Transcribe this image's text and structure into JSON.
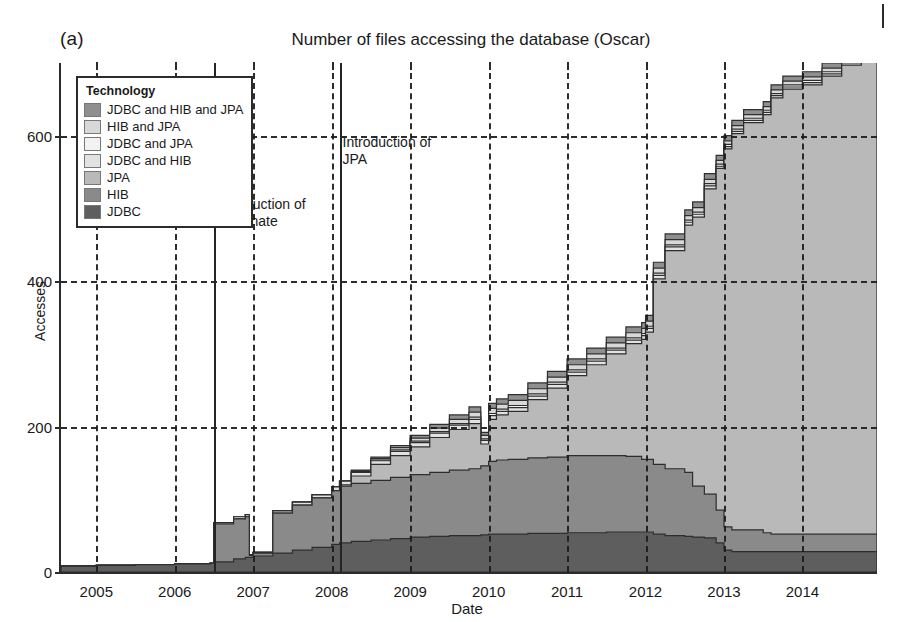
{
  "figure": {
    "panel_label": "(a)",
    "title": "Number of files accessing the database (Oscar)"
  },
  "legend": {
    "title": "Technology",
    "items": [
      {
        "label": "JDBC and HIB and JPA",
        "color": "#8f8f8f"
      },
      {
        "label": "HIB and JPA",
        "color": "#d8d8d8"
      },
      {
        "label": "JDBC and JPA",
        "color": "#f2f2f2"
      },
      {
        "label": "JDBC and HIB",
        "color": "#e2e2e2"
      },
      {
        "label": "JPA",
        "color": "#b9b9b9"
      },
      {
        "label": "HIB",
        "color": "#8a8a8a"
      },
      {
        "label": "JDBC",
        "color": "#5e5e5e"
      }
    ]
  },
  "annotations": [
    {
      "text": "Introduction of\nHibernate",
      "x": 2006.5
    },
    {
      "text": "Introduction of\nJPA",
      "x": 2008.1
    }
  ],
  "chart_data": {
    "type": "area",
    "stacked": true,
    "title": "Number of files accessing the database (Oscar)",
    "xlabel": "Date",
    "ylabel": "Accesses",
    "xlim": [
      2004.55,
      2014.95
    ],
    "ylim": [
      0,
      700
    ],
    "xticks": [
      2005,
      2006,
      2007,
      2008,
      2009,
      2010,
      2011,
      2012,
      2013,
      2014
    ],
    "yticks": [
      0,
      200,
      400,
      600
    ],
    "grid": "dashed both axes",
    "legend_position": "upper-left inside",
    "x": [
      2004.55,
      2005.0,
      2005.5,
      2006.0,
      2006.45,
      2006.5,
      2006.75,
      2006.9,
      2006.95,
      2007.0,
      2007.25,
      2007.5,
      2007.75,
      2008.0,
      2008.1,
      2008.25,
      2008.5,
      2008.75,
      2009.0,
      2009.25,
      2009.5,
      2009.75,
      2009.9,
      2010.0,
      2010.1,
      2010.25,
      2010.5,
      2010.75,
      2011.0,
      2011.25,
      2011.5,
      2011.75,
      2011.95,
      2012.0,
      2012.1,
      2012.25,
      2012.5,
      2012.6,
      2012.75,
      2012.9,
      2013.0,
      2013.1,
      2013.25,
      2013.5,
      2013.6,
      2013.75,
      2014.0,
      2014.25,
      2014.5,
      2014.75,
      2014.95
    ],
    "series": [
      {
        "name": "JDBC",
        "color": "#5e5e5e",
        "values": [
          8,
          9,
          10,
          11,
          12,
          14,
          18,
          20,
          20,
          22,
          26,
          30,
          34,
          38,
          40,
          42,
          44,
          46,
          48,
          49,
          50,
          50,
          51,
          52,
          52,
          52,
          53,
          53,
          54,
          54,
          55,
          55,
          55,
          55,
          52,
          50,
          49,
          48,
          47,
          40,
          30,
          28,
          28,
          28,
          28,
          28,
          28,
          28,
          28,
          28,
          28
        ]
      },
      {
        "name": "HIB",
        "color": "#8a8a8a",
        "values": [
          0,
          0,
          0,
          0,
          0,
          52,
          55,
          56,
          3,
          4,
          55,
          62,
          68,
          74,
          78,
          80,
          82,
          84,
          86,
          88,
          90,
          92,
          95,
          100,
          102,
          103,
          104,
          105,
          106,
          106,
          105,
          104,
          100,
          100,
          96,
          92,
          88,
          70,
          60,
          45,
          32,
          30,
          30,
          26,
          24,
          24,
          24,
          24,
          24,
          24,
          24
        ]
      },
      {
        "name": "JPA",
        "color": "#b9b9b9",
        "values": [
          0,
          0,
          0,
          0,
          0,
          0,
          0,
          0,
          0,
          0,
          0,
          0,
          0,
          0,
          2,
          10,
          22,
          30,
          38,
          48,
          56,
          62,
          30,
          58,
          62,
          66,
          80,
          95,
          110,
          125,
          140,
          155,
          165,
          175,
          255,
          300,
          340,
          370,
          420,
          470,
          520,
          545,
          560,
          575,
          600,
          612,
          618,
          630,
          645,
          660,
          668
        ]
      },
      {
        "name": "JDBC and HIB",
        "color": "#e2e2e2",
        "values": [
          0,
          0,
          0,
          0,
          0,
          2,
          3,
          3,
          1,
          1,
          3,
          4,
          4,
          5,
          5,
          5,
          5,
          6,
          6,
          6,
          6,
          6,
          5,
          5,
          5,
          5,
          5,
          5,
          5,
          5,
          5,
          5,
          5,
          5,
          5,
          5,
          4,
          4,
          4,
          3,
          3,
          3,
          3,
          3,
          3,
          3,
          3,
          3,
          3,
          3,
          3
        ]
      },
      {
        "name": "JDBC and JPA",
        "color": "#f2f2f2",
        "values": [
          0,
          0,
          0,
          0,
          0,
          0,
          0,
          0,
          0,
          0,
          0,
          0,
          0,
          0,
          0,
          1,
          1,
          2,
          2,
          2,
          2,
          3,
          2,
          3,
          3,
          3,
          3,
          3,
          3,
          3,
          3,
          3,
          3,
          3,
          3,
          3,
          3,
          3,
          3,
          3,
          3,
          3,
          3,
          3,
          3,
          3,
          3,
          3,
          3,
          3,
          3
        ]
      },
      {
        "name": "HIB and JPA",
        "color": "#d8d8d8",
        "values": [
          0,
          0,
          0,
          0,
          0,
          0,
          0,
          0,
          0,
          0,
          0,
          0,
          0,
          0,
          0,
          1,
          2,
          3,
          4,
          5,
          6,
          7,
          5,
          7,
          7,
          7,
          7,
          7,
          7,
          7,
          7,
          7,
          7,
          7,
          7,
          7,
          6,
          6,
          6,
          5,
          5,
          5,
          5,
          5,
          5,
          5,
          5,
          5,
          5,
          5,
          5
        ]
      },
      {
        "name": "JDBC and HIB and JPA",
        "color": "#8f8f8f",
        "values": [
          0,
          0,
          0,
          0,
          0,
          0,
          0,
          0,
          0,
          0,
          0,
          0,
          0,
          0,
          0,
          1,
          2,
          3,
          4,
          5,
          6,
          7,
          4,
          7,
          7,
          8,
          8,
          8,
          8,
          8,
          8,
          8,
          8,
          8,
          8,
          8,
          8,
          8,
          8,
          7,
          7,
          7,
          7,
          7,
          7,
          7,
          7,
          7,
          7,
          7,
          7
        ]
      }
    ]
  }
}
